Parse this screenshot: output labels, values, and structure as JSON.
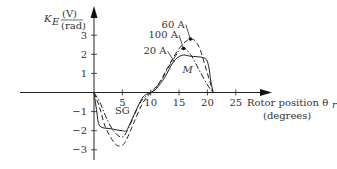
{
  "chart_data": {
    "type": "line",
    "title": "",
    "xlabel": "Rotor position θr (degrees)",
    "xlabel_line1": "Rotor position θ",
    "xlabel_sub": "r",
    "xlabel_line2": "(degrees)",
    "ylabel": "K_E (V)/(rad)",
    "ylabel_main": "K",
    "ylabel_sub": "E",
    "ylabel_num": "(V)",
    "ylabel_den": "(rad)",
    "xticks": [
      5,
      10,
      15,
      20,
      25
    ],
    "yticks": [
      -3,
      -2,
      -1,
      1,
      2,
      3
    ],
    "xlim": [
      -16.5,
      30
    ],
    "ylim": [
      -3.7,
      3.9
    ],
    "grid": false,
    "legend_position": "annotations near curves",
    "series": [
      {
        "name": "20 A",
        "style": "solid",
        "x": [
          0,
          0.5,
          1,
          3,
          5,
          5.8,
          7,
          8.5,
          9.5,
          10,
          11,
          12.5,
          14,
          15.5,
          17,
          19.5,
          20.2,
          20.6,
          21
        ],
        "y": [
          0,
          -1.0,
          -1.75,
          -1.9,
          -2.0,
          -1.95,
          -1.2,
          -0.3,
          -0.05,
          0,
          0.2,
          0.8,
          1.6,
          1.95,
          1.9,
          1.8,
          1.4,
          0.6,
          0
        ]
      },
      {
        "name": "60 A",
        "style": "dashed",
        "x": [
          0,
          1,
          2,
          3.5,
          4.5,
          5.5,
          7,
          8.5,
          10,
          11.5,
          13,
          15,
          17,
          18.5,
          20,
          21
        ],
        "y": [
          0,
          -0.8,
          -1.8,
          -2.6,
          -2.8,
          -2.6,
          -1.6,
          -0.6,
          0,
          0.5,
          1.3,
          2.3,
          2.8,
          2.4,
          1.0,
          0
        ]
      },
      {
        "name": "100 A",
        "style": "dash-dot",
        "x": [
          0,
          1,
          2,
          3,
          4,
          5.2,
          6.5,
          8,
          9.5,
          10.5,
          12,
          13.5,
          15.5,
          17,
          18.5,
          20,
          21
        ],
        "y": [
          0,
          -0.5,
          -1.2,
          -1.8,
          -2.2,
          -2.3,
          -1.6,
          -0.6,
          -0.1,
          0.1,
          0.7,
          1.5,
          2.3,
          2.0,
          1.2,
          0.4,
          0
        ]
      }
    ],
    "annotations": [
      {
        "text": "60 A",
        "x": 16,
        "y": 3.4,
        "arrow_to": [
          17,
          2.8
        ]
      },
      {
        "text": "100 A",
        "x": 14.8,
        "y": 2.85,
        "arrow_to": [
          15.8,
          2.3
        ]
      },
      {
        "text": "20 A",
        "x": 12.8,
        "y": 2.0,
        "arrow_to": [
          14.2,
          1.6
        ]
      },
      {
        "text": "M",
        "x": 16.5,
        "y": 1.0,
        "italic": true
      },
      {
        "text": "SG",
        "x": 5,
        "y": -1.1
      }
    ]
  }
}
